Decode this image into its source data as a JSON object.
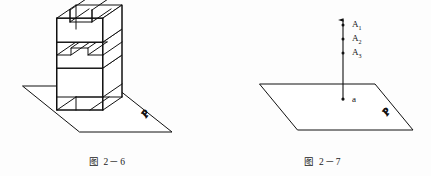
{
  "page": {
    "background_color": "#fdfdfd",
    "ink_color": "#111111",
    "width": 431,
    "height": 176
  },
  "figures": [
    {
      "id": "fig-2-6",
      "caption": "图 2－6",
      "kind": "isometric-solid-on-plane",
      "description": "stepped notched block standing on plane P",
      "plane_label": "P",
      "labels": []
    },
    {
      "id": "fig-2-7",
      "caption": "图 2－7",
      "kind": "line-piercing-plane",
      "description": "vertical line with arrow, marked points A1 A2 A3 above plane and piercing point a on plane P",
      "plane_label": "P",
      "labels": [
        {
          "name": "A",
          "sub": "1"
        },
        {
          "name": "A",
          "sub": "2"
        },
        {
          "name": "A",
          "sub": "3"
        },
        {
          "name": "a",
          "sub": ""
        }
      ]
    }
  ]
}
